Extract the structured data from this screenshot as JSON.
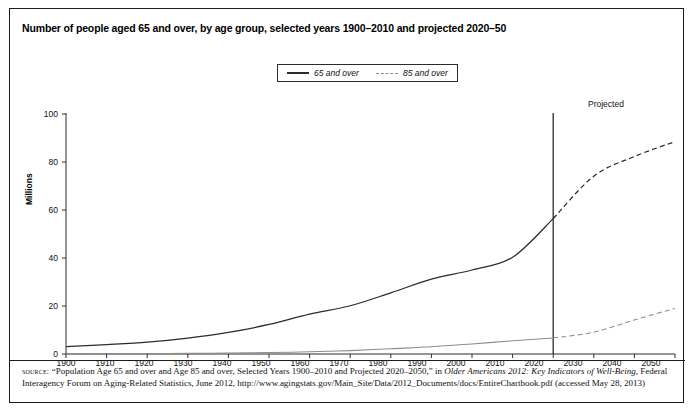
{
  "title": "Number of people aged 65 and over, by age group, selected years 1900–2010 and projected 2020–50",
  "legend": {
    "entries": [
      {
        "label": "65 and over",
        "style": "solid",
        "color": "#2b2b2b"
      },
      {
        "label": "85 and over",
        "style": "dashed",
        "color": "#8c8c8c"
      }
    ]
  },
  "annotations": {
    "projected": "Projected"
  },
  "axis": {
    "ylabel": "Millions",
    "yticks": [
      "0",
      "20",
      "40",
      "60",
      "80",
      "100"
    ],
    "xticks": [
      "1900",
      "1910",
      "1920",
      "1930",
      "1940",
      "1950",
      "1960",
      "1970",
      "1980",
      "1990",
      "2000",
      "2010",
      "2020",
      "2030",
      "2040",
      "2050"
    ]
  },
  "source": {
    "label": "source:",
    "text_1": " “Population Age 65 and over and Age 85 and over, Selected Years 1900–2010 and Projected 2020–2050,” in ",
    "italic_1": "Older Americans 2012: Key Indicators of Well-Being",
    "text_2": ", Federal Interagency Forum on Aging-Related Statistics, June 2012, http://www.agingstats.gov/Main_Site/Data/2012_Documents/docs/EntireChartbook.pdf (accessed May 28, 2013)"
  },
  "chart_data": {
    "type": "line",
    "title": "Number of people aged 65 and over, by age group, selected years 1900–2010 and projected 2020–50",
    "xlabel": "",
    "ylabel": "Millions",
    "xlim": [
      1900,
      2050
    ],
    "ylim": [
      0,
      100
    ],
    "grid": false,
    "legend_position": "top-center",
    "projection_divider_x": 2020,
    "x": [
      1900,
      1910,
      1920,
      1930,
      1940,
      1950,
      1960,
      1970,
      1980,
      1990,
      2000,
      2010,
      2020,
      2030,
      2040,
      2050
    ],
    "series": [
      {
        "name": "65 and over",
        "style": "solid",
        "color": "#2b2b2b",
        "values": [
          3.1,
          3.9,
          4.9,
          6.6,
          9.0,
          12.3,
          16.6,
          20.1,
          25.5,
          31.2,
          35.0,
          40.3,
          56.4,
          74.1,
          82.3,
          88.5
        ],
        "projected_from": 2020
      },
      {
        "name": "85 and over",
        "style": "dashed",
        "color": "#8c8c8c",
        "values": [
          0.1,
          0.2,
          0.2,
          0.3,
          0.4,
          0.6,
          0.9,
          1.4,
          2.2,
          3.0,
          4.2,
          5.5,
          6.7,
          9.1,
          14.2,
          19.0
        ],
        "projected_from": 2020
      }
    ]
  }
}
